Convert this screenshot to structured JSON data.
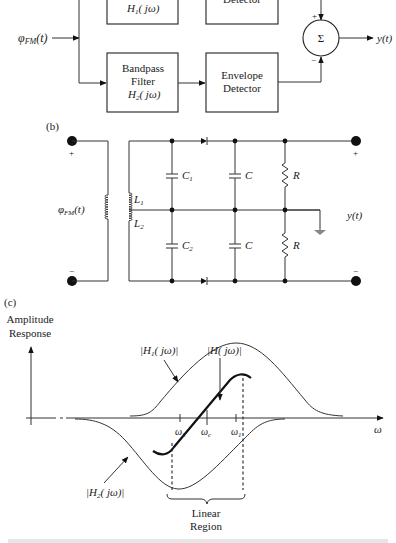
{
  "part_a": {
    "input_label": "φFM(t)",
    "input_sym": "φ",
    "input_sub": "FM",
    "input_arg": "(t)",
    "upper_filter": {
      "line": "H",
      "sub": "1",
      "arg": "( jω)"
    },
    "upper_detector": {
      "label": "Detector"
    },
    "lower_filter": {
      "line1": "Bandpass",
      "line2": "Filter",
      "line3": "H",
      "sub": "2",
      "arg": "( jω)"
    },
    "lower_detector": {
      "line1": "Envelope",
      "line2": "Detector"
    },
    "summer": {
      "symbol": "Σ",
      "plus": "+",
      "minus": "−"
    },
    "output_label": "y(t)"
  },
  "part_b": {
    "label": "(b)",
    "input_label": "φFM(t)",
    "input_sym": "φ",
    "input_sub": "FM",
    "input_arg": "(t)",
    "plus": "+",
    "minus": "−",
    "L1": {
      "sym": "L",
      "sub": "1"
    },
    "L2": {
      "sym": "L",
      "sub": "2"
    },
    "C1": {
      "sym": "C",
      "sub": "1"
    },
    "C2": {
      "sym": "C",
      "sub": "2"
    },
    "C": "C",
    "R": "R",
    "output_label": "y(t)"
  },
  "part_c": {
    "label": "(c)",
    "y_axis_line1": "Amplitude",
    "y_axis_line2": "Response",
    "x_axis_label": "ω",
    "h1_label": "|H1( jω)|",
    "h1": {
      "pre": "|H",
      "sub": "1",
      "post": "( jω)|"
    },
    "h2": {
      "pre": "|H",
      "sub": "2",
      "post": "( jω)|"
    },
    "h": {
      "pre": "|H",
      "post": "( jω)|"
    },
    "ticks": {
      "w2": {
        "sym": "ω",
        "sub": "2"
      },
      "wc": {
        "sym": "ω",
        "sub": "c"
      },
      "w1": {
        "sym": "ω",
        "sub": "1"
      }
    },
    "region_line1": "Linear",
    "region_line2": "Region"
  }
}
